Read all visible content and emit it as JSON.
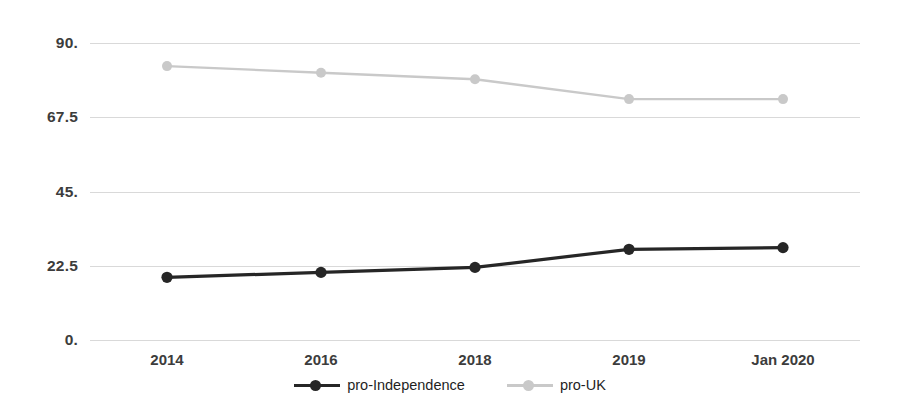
{
  "chart_data": {
    "type": "line",
    "title": "",
    "subtitle": "",
    "xlabel": "",
    "ylabel": "",
    "categories": [
      "2014",
      "2016",
      "2018",
      "2019",
      "Jan 2020"
    ],
    "yticks": [
      "0.",
      "22.5",
      "45.",
      "67.5",
      "90."
    ],
    "ytick_values": [
      0,
      22.5,
      45,
      67.5,
      90
    ],
    "ylim": [
      0,
      90
    ],
    "grid": true,
    "legend_position": "bottom",
    "series": [
      {
        "name": "pro-Independence",
        "color": "#262626",
        "marker": "circle",
        "values": [
          19,
          20.5,
          22,
          27.5,
          28
        ]
      },
      {
        "name": "pro-UK",
        "color": "#c9c9c9",
        "marker": "circle",
        "values": [
          83,
          81,
          79,
          73,
          73
        ]
      }
    ]
  },
  "legend": {
    "items": [
      {
        "label": "pro-Independence",
        "color": "#262626"
      },
      {
        "label": "pro-UK",
        "color": "#c9c9c9"
      }
    ]
  },
  "colors": {
    "background": "#ffffff",
    "gridline": "#d9d9d9",
    "axis_text": "#3c3c3c",
    "series_dark": "#262626",
    "series_light": "#c9c9c9"
  }
}
